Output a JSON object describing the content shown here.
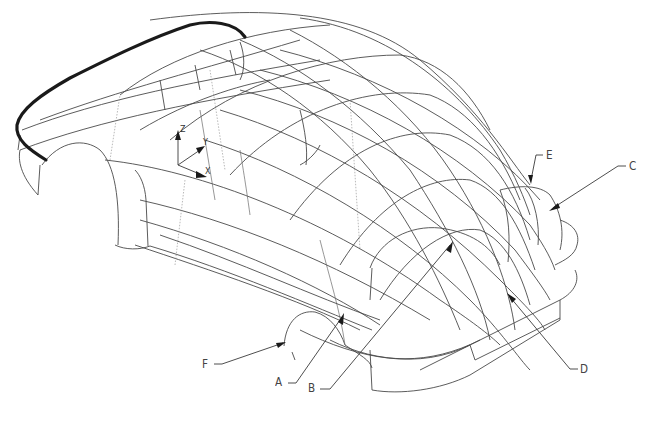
{
  "figure": {
    "type": "3D wireframe surface model of a car body (isometric CAD view)",
    "line_color": "#4a4a4a",
    "highlight_line_color": "#1a1a1a",
    "background": "#ffffff"
  },
  "callouts": [
    {
      "id": "A",
      "label": "A",
      "text_x": 275,
      "text_y": 373,
      "target": [
        342,
        317
      ]
    },
    {
      "id": "B",
      "label": "B",
      "text_x": 307,
      "text_y": 381,
      "target": [
        450,
        245
      ]
    },
    {
      "id": "C",
      "label": "C",
      "text_x": 630,
      "text_y": 159,
      "target": [
        553,
        208
      ]
    },
    {
      "id": "D",
      "label": "D",
      "text_x": 582,
      "text_y": 362,
      "target": [
        510,
        297
      ]
    },
    {
      "id": "E",
      "label": "E",
      "text_x": 547,
      "text_y": 148,
      "target": [
        531,
        180
      ]
    },
    {
      "id": "F",
      "label": "F",
      "text_x": 201,
      "text_y": 357,
      "target": [
        283,
        343
      ]
    }
  ],
  "axes": {
    "z_label": "Z",
    "y_label": "Y",
    "x_label": "X",
    "origin": [
      178,
      165
    ]
  }
}
